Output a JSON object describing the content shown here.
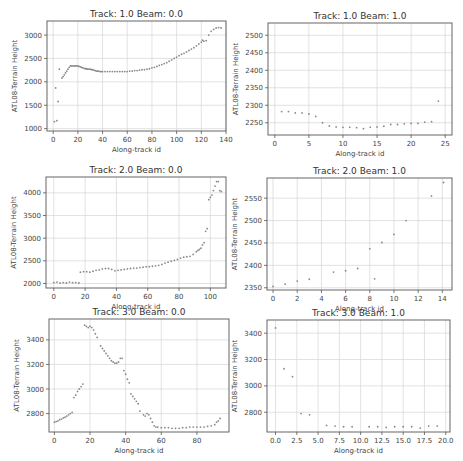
{
  "chart_data": [
    {
      "type": "scatter",
      "title": "Track: 1.0 Beam: 0.0",
      "xlabel": "Along-track id",
      "ylabel": "ATL08-Terrain Height",
      "xlim": [
        -5,
        140
      ],
      "ylim": [
        950,
        3300
      ],
      "xticks": [
        0,
        20,
        40,
        60,
        80,
        100,
        120,
        140
      ],
      "yticks": [
        1000,
        1500,
        2000,
        2500,
        3000
      ],
      "grid": true,
      "x": [
        1,
        2,
        3,
        4,
        5,
        7,
        8,
        9,
        10,
        11,
        12,
        13,
        14,
        15,
        16,
        17,
        18,
        19,
        20,
        21,
        22,
        23,
        24,
        25,
        26,
        27,
        28,
        29,
        30,
        31,
        32,
        33,
        34,
        35,
        36,
        37,
        38,
        39,
        40,
        42,
        44,
        46,
        48,
        50,
        52,
        54,
        56,
        58,
        60,
        62,
        64,
        66,
        68,
        70,
        72,
        74,
        76,
        78,
        80,
        82,
        84,
        86,
        88,
        90,
        92,
        94,
        96,
        98,
        100,
        102,
        104,
        106,
        108,
        110,
        112,
        114,
        116,
        118,
        120,
        121,
        122,
        124,
        126,
        128,
        130,
        132,
        134,
        136
      ],
      "y": [
        1150,
        1870,
        1170,
        1580,
        2270,
        2080,
        2110,
        2150,
        2190,
        2230,
        2270,
        2310,
        2340,
        2340,
        2340,
        2340,
        2340,
        2340,
        2340,
        2330,
        2320,
        2310,
        2300,
        2290,
        2280,
        2280,
        2270,
        2270,
        2270,
        2260,
        2260,
        2250,
        2240,
        2230,
        2230,
        2230,
        2220,
        2220,
        2220,
        2220,
        2220,
        2220,
        2220,
        2220,
        2220,
        2220,
        2220,
        2220,
        2220,
        2230,
        2230,
        2240,
        2240,
        2250,
        2260,
        2260,
        2270,
        2280,
        2300,
        2310,
        2330,
        2350,
        2370,
        2390,
        2410,
        2440,
        2470,
        2500,
        2530,
        2560,
        2590,
        2610,
        2640,
        2670,
        2700,
        2730,
        2770,
        2810,
        2850,
        2890,
        2870,
        2880,
        3000,
        3080,
        3120,
        3150,
        3160,
        3150
      ]
    },
    {
      "type": "scatter",
      "title": "Track: 1.0 Beam: 1.0",
      "xlabel": "Along-track id",
      "ylabel": "ATL08-Terrain Height",
      "xlim": [
        -1,
        26
      ],
      "ylim": [
        2215,
        2535
      ],
      "xticks": [
        0,
        5,
        10,
        15,
        20,
        25
      ],
      "yticks": [
        2250,
        2300,
        2350,
        2400,
        2450,
        2500
      ],
      "grid": true,
      "x": [
        1,
        2,
        3,
        4,
        5,
        6,
        7,
        8,
        9,
        10,
        11,
        12,
        13,
        14,
        15,
        16,
        17,
        18,
        19,
        20,
        21,
        22,
        23,
        24
      ],
      "y": [
        2282,
        2282,
        2278,
        2278,
        2275,
        2268,
        2250,
        2241,
        2238,
        2237,
        2237,
        2236,
        2233,
        2237,
        2238,
        2240,
        2245,
        2245,
        2247,
        2248,
        2248,
        2252,
        2253,
        2312
      ]
    },
    {
      "type": "scatter",
      "title": "Track: 2.0 Beam: 0.0",
      "xlabel": "Along-track id",
      "ylabel": "ATL08-Terrain Height",
      "xlim": [
        -5,
        110
      ],
      "ylim": [
        1900,
        4350
      ],
      "xticks": [
        0,
        20,
        40,
        60,
        80,
        100
      ],
      "yticks": [
        2000,
        2500,
        3000,
        3500,
        4000
      ],
      "grid": true,
      "x": [
        0,
        2,
        4,
        6,
        8,
        10,
        12,
        14,
        16,
        17,
        19,
        21,
        23,
        25,
        27,
        29,
        31,
        33,
        35,
        37,
        39,
        41,
        43,
        45,
        47,
        49,
        51,
        53,
        55,
        57,
        59,
        61,
        63,
        65,
        67,
        69,
        71,
        73,
        75,
        77,
        79,
        81,
        83,
        85,
        87,
        89,
        91,
        92,
        93,
        94,
        95,
        96,
        97,
        98,
        99,
        100,
        101,
        102,
        103,
        104,
        105,
        106,
        107
      ],
      "y": [
        2020,
        2030,
        2010,
        2020,
        2010,
        2030,
        2020,
        2020,
        2010,
        2250,
        2260,
        2260,
        2250,
        2270,
        2290,
        2300,
        2320,
        2330,
        2330,
        2310,
        2280,
        2290,
        2300,
        2310,
        2320,
        2330,
        2340,
        2340,
        2350,
        2360,
        2370,
        2370,
        2380,
        2390,
        2400,
        2420,
        2450,
        2470,
        2490,
        2510,
        2530,
        2560,
        2580,
        2590,
        2600,
        2640,
        2700,
        2730,
        2750,
        2780,
        2850,
        2900,
        3150,
        3210,
        3850,
        3900,
        3950,
        4050,
        4150,
        4250,
        4250,
        4050,
        4030
      ]
    },
    {
      "type": "scatter",
      "title": "Track: 2.0 Beam: 1.0",
      "xlabel": "Along-track id",
      "ylabel": "ATL08-Terrain Height",
      "xlim": [
        -0.5,
        14.8
      ],
      "ylim": [
        2345,
        2595
      ],
      "xticks": [
        0,
        2,
        4,
        6,
        8,
        10,
        12,
        14
      ],
      "yticks": [
        2350,
        2400,
        2450,
        2500,
        2550
      ],
      "grid": true,
      "x": [
        0,
        1,
        2,
        3,
        5,
        6,
        7,
        8,
        8.4,
        9,
        10,
        11,
        13.1,
        14.1
      ],
      "y": [
        2353,
        2358,
        2365,
        2369,
        2385,
        2388,
        2393,
        2437,
        2370,
        2451,
        2469,
        2500,
        2555,
        2585
      ]
    },
    {
      "type": "scatter",
      "title": "Track: 3.0 Beam: 0.0",
      "xlabel": "Along-track id",
      "ylabel": "ATL08-Terrain Height",
      "xlim": [
        -3,
        98
      ],
      "ylim": [
        2650,
        3570
      ],
      "xticks": [
        0,
        20,
        40,
        60,
        80
      ],
      "yticks": [
        2800,
        3000,
        3200,
        3400
      ],
      "grid": true,
      "x": [
        0,
        1,
        2,
        3,
        4,
        5,
        6,
        7,
        8,
        9,
        10,
        11,
        12,
        13,
        14,
        15,
        16,
        17,
        18,
        19,
        20,
        21,
        22,
        23,
        24,
        26,
        27,
        28,
        29,
        30,
        31,
        32,
        33,
        34,
        35,
        36,
        37,
        38,
        39,
        40,
        41,
        42,
        43,
        44,
        45,
        46,
        47,
        48,
        50,
        51,
        52,
        53,
        54,
        55,
        56,
        57,
        58,
        60,
        62,
        64,
        66,
        68,
        70,
        72,
        74,
        76,
        78,
        80,
        82,
        84,
        86,
        88,
        90,
        91,
        92,
        93
      ],
      "y": [
        2730,
        2735,
        2740,
        2750,
        2755,
        2765,
        2770,
        2780,
        2790,
        2800,
        2810,
        2930,
        2950,
        2980,
        3000,
        3020,
        3040,
        3520,
        3510,
        3500,
        3510,
        3500,
        3480,
        3450,
        3420,
        3350,
        3330,
        3310,
        3290,
        3270,
        3250,
        3230,
        3220,
        3210,
        3210,
        3220,
        3250,
        3250,
        3150,
        3120,
        3080,
        3050,
        2960,
        2940,
        2920,
        2900,
        2880,
        2820,
        2790,
        2780,
        2800,
        2790,
        2760,
        2730,
        2700,
        2690,
        2690,
        2685,
        2685,
        2685,
        2680,
        2680,
        2680,
        2685,
        2685,
        2690,
        2690,
        2690,
        2690,
        2690,
        2695,
        2700,
        2710,
        2730,
        2740,
        2760
      ]
    },
    {
      "type": "scatter",
      "title": "Track: 3.0 Beam: 1.0",
      "xlabel": "Along-track id",
      "ylabel": "ATL08-Terrain Height",
      "xlim": [
        -1,
        20.5
      ],
      "ylim": [
        2650,
        3500
      ],
      "xticks": [
        0.0,
        2.5,
        5.0,
        7.5,
        10.0,
        12.5,
        15.0,
        17.5,
        20.0
      ],
      "xtick_labels": [
        "0.0",
        "2.5",
        "5.0",
        "7.5",
        "10.0",
        "12.5",
        "15.0",
        "17.5",
        "20.0"
      ],
      "yticks": [
        2800,
        3000,
        3200,
        3400
      ],
      "grid": true,
      "x": [
        0,
        1,
        2,
        3,
        4,
        6,
        7,
        8,
        9,
        11,
        12,
        13,
        14,
        15,
        16,
        17,
        18,
        19
      ],
      "y": [
        3440,
        3130,
        3070,
        2790,
        2780,
        2700,
        2695,
        2690,
        2690,
        2690,
        2690,
        2685,
        2690,
        2690,
        2690,
        2680,
        2695,
        2695
      ]
    }
  ]
}
